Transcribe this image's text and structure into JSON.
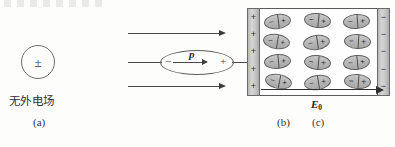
{
  "figure": {
    "type": "physics-diagram",
    "topic": "dielectric-polarization",
    "panels": [
      {
        "id": "a",
        "caption": "(a)",
        "description_label": "无外电场",
        "atom_symbol": "±"
      },
      {
        "id": "b",
        "caption": "(b)",
        "dipole_minus": "−",
        "dipole_plus": "+",
        "dipole_moment_label": "p",
        "field_label": "E",
        "field_subscript": "0",
        "field_line_count": 3
      },
      {
        "id": "c",
        "caption": "(c)",
        "plate_positive_sign": "+",
        "plate_negative_sign": "−",
        "plate_positive_count": 5,
        "plate_negative_count": 5,
        "molecule_rows": 4,
        "molecule_columns": 3,
        "molecule_total": 12,
        "molecule_neg": "−",
        "molecule_pos": "+",
        "field_label": "E",
        "field_subscript": "0"
      }
    ]
  },
  "colors": {
    "background": "#fdfdfc",
    "ink": "#2b2b2b",
    "line": "#4a4a4a",
    "plate_fill": "#c4c4c4",
    "molecule_fill": "#b4b4b4",
    "box_border": "#5a5a5a"
  }
}
